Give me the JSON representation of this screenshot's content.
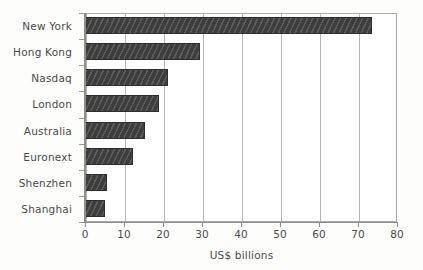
{
  "chart_data": {
    "type": "bar",
    "orientation": "horizontal",
    "title": "",
    "subtitle": "",
    "xlabel": "US$ billions",
    "ylabel": "",
    "categories": [
      "New York",
      "Hong Kong",
      "Nasdaq",
      "London",
      "Australia",
      "Euronext",
      "Shenzhen",
      "Shanghai"
    ],
    "values": [
      73.5,
      29.5,
      21.3,
      19.0,
      15.5,
      12.3,
      5.7,
      5.2
    ],
    "xlim": [
      0,
      80
    ],
    "xticks": [
      0,
      10,
      20,
      30,
      40,
      50,
      60,
      70,
      80
    ],
    "xtick_labels": [
      "0",
      "10",
      "20",
      "30",
      "40",
      "50",
      "60",
      "70",
      "80"
    ],
    "grid": "vertical",
    "legend": "none",
    "bar_color": "#3d3d3d",
    "axis_color": "#8d8d8a",
    "grid_color": "#b6b6b3",
    "text_color": "#4a4a4a",
    "background": "#ffffff"
  }
}
